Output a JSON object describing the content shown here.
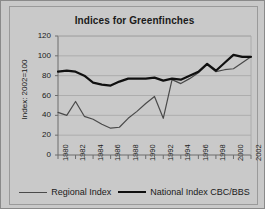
{
  "chart_data": {
    "type": "line",
    "title": "Indices for Greenfinches",
    "xlabel": "",
    "ylabel": "Index: 2002=100",
    "ylim": [
      0,
      120
    ],
    "yticks": [
      0,
      20,
      40,
      60,
      80,
      100,
      120
    ],
    "ytick_labels": [
      "0",
      "20",
      "40",
      "60",
      "80",
      "100",
      "120"
    ],
    "grid": true,
    "legend_position": "bottom",
    "x": [
      1980,
      1981,
      1982,
      1983,
      1984,
      1985,
      1986,
      1987,
      1988,
      1989,
      1990,
      1991,
      1992,
      1993,
      1994,
      1995,
      1996,
      1997,
      1998,
      1999,
      2000,
      2001,
      2002
    ],
    "xtick_labels": [
      "1980",
      "1982",
      "1984",
      "1986",
      "1988",
      "1990",
      "1992",
      "1994",
      "1996",
      "1998",
      "2000",
      "2002"
    ],
    "xtick_values": [
      1980,
      1982,
      1984,
      1986,
      1988,
      1990,
      1992,
      1994,
      1996,
      1998,
      2000,
      2002
    ],
    "series": [
      {
        "name": "Regional Index",
        "color": "#4a4a4a",
        "width": 1.2,
        "values": [
          43,
          40,
          54,
          39,
          36,
          31,
          27,
          28,
          37,
          44,
          52,
          59,
          37,
          76,
          72,
          77,
          83,
          91,
          84,
          86,
          87,
          93,
          99
        ]
      },
      {
        "name": "National Index CBC/BBS",
        "color": "#101010",
        "width": 2.2,
        "values": [
          84,
          85,
          84,
          80,
          73,
          71,
          70,
          74,
          77,
          77,
          77,
          78,
          75,
          77,
          76,
          80,
          84,
          92,
          85,
          93,
          101,
          99,
          99
        ]
      }
    ]
  },
  "legend": {
    "items": [
      {
        "label": "Regional Index"
      },
      {
        "label": "National Index CBC/BBS"
      }
    ]
  }
}
